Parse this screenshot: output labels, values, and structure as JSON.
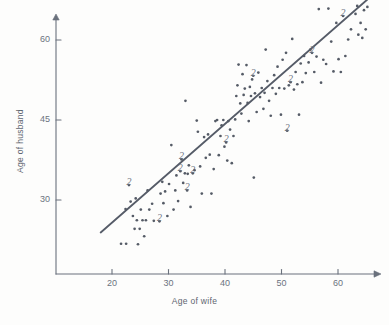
{
  "figure": {
    "background": "#fdfdfc",
    "ink_color": "#6a717c",
    "point_color": "#555b66",
    "line_color": "#565c68"
  },
  "axes": {
    "x_title": "Age of wife",
    "y_title": "Age of husband",
    "x_ticks": [
      20,
      30,
      40,
      50,
      60
    ],
    "y_ticks": [
      30,
      45,
      60
    ],
    "x_tick_labels": [
      "20",
      "30",
      "40",
      "50",
      "60"
    ],
    "y_tick_labels": [
      "30",
      "45",
      "60"
    ],
    "xlim": [
      12,
      67
    ],
    "ylim": [
      18,
      68
    ],
    "x_axis_pixel_y": 274,
    "y_axis_pixel_x": 56,
    "px_per_year_x": 5.65,
    "px_per_year_y": 5.333,
    "grid": false,
    "arrows": true
  },
  "chart_data": {
    "type": "scatter",
    "title": "",
    "xlabel": "Age of wife",
    "ylabel": "Age of husband",
    "xlim": [
      12,
      67
    ],
    "ylim": [
      18,
      68
    ],
    "grid": false,
    "legend": "none",
    "marker": "dot",
    "duplicate_marker_label": "2",
    "annotations": [
      {
        "text": "2",
        "x": 23.0,
        "y": 32.8
      },
      {
        "text": "2",
        "x": 28.4,
        "y": 26.0
      },
      {
        "text": "2",
        "x": 32.3,
        "y": 37.6
      },
      {
        "text": "2",
        "x": 32.1,
        "y": 35.4
      },
      {
        "text": "2",
        "x": 33.3,
        "y": 31.8
      },
      {
        "text": "2",
        "x": 34.3,
        "y": 35.0
      },
      {
        "text": "2",
        "x": 40.2,
        "y": 40.8
      },
      {
        "text": "2",
        "x": 45.0,
        "y": 53.3
      },
      {
        "text": "2",
        "x": 51.0,
        "y": 43.0
      },
      {
        "text": "2",
        "x": 51.6,
        "y": 52.1
      },
      {
        "text": "2",
        "x": 55.4,
        "y": 57.6
      },
      {
        "text": "2",
        "x": 60.9,
        "y": 64.5
      }
    ],
    "regression_line": {
      "x1": 18.0,
      "y1": 23.9,
      "x2": 65.2,
      "y2": 67.6,
      "style": "solid",
      "color": "#565c68"
    },
    "points": [
      [
        21.6,
        21.8
      ],
      [
        22.5,
        21.8
      ],
      [
        22.4,
        28.3
      ],
      [
        23.0,
        32.8
      ],
      [
        23.3,
        29.7
      ],
      [
        23.7,
        27.0
      ],
      [
        24.0,
        24.6
      ],
      [
        24.2,
        30.3
      ],
      [
        24.4,
        26.2
      ],
      [
        24.6,
        21.7
      ],
      [
        24.9,
        24.6
      ],
      [
        25.1,
        28.2
      ],
      [
        25.4,
        26.2
      ],
      [
        25.7,
        23.2
      ],
      [
        26.0,
        26.2
      ],
      [
        26.3,
        31.8
      ],
      [
        26.6,
        28.2
      ],
      [
        27.1,
        29.3
      ],
      [
        27.4,
        26.1
      ],
      [
        28.4,
        26.0
      ],
      [
        28.6,
        31.2
      ],
      [
        28.9,
        33.4
      ],
      [
        29.1,
        29.4
      ],
      [
        29.4,
        31.6
      ],
      [
        29.8,
        27.0
      ],
      [
        30.1,
        33.0
      ],
      [
        30.5,
        40.3
      ],
      [
        30.9,
        28.2
      ],
      [
        31.2,
        31.8
      ],
      [
        31.4,
        34.6
      ],
      [
        31.7,
        29.8
      ],
      [
        32.1,
        35.4
      ],
      [
        32.3,
        37.6
      ],
      [
        32.6,
        33.2
      ],
      [
        32.9,
        35.0
      ],
      [
        33.0,
        48.6
      ],
      [
        33.3,
        31.8
      ],
      [
        33.4,
        34.9
      ],
      [
        33.6,
        36.5
      ],
      [
        33.9,
        28.7
      ],
      [
        34.3,
        35.0
      ],
      [
        34.6,
        35.6
      ],
      [
        35.0,
        44.9
      ],
      [
        35.2,
        42.8
      ],
      [
        35.6,
        36.3
      ],
      [
        35.9,
        31.2
      ],
      [
        36.3,
        41.8
      ],
      [
        36.6,
        37.9
      ],
      [
        37.0,
        42.3
      ],
      [
        37.3,
        38.5
      ],
      [
        37.6,
        31.2
      ],
      [
        38.0,
        35.8
      ],
      [
        38.3,
        44.8
      ],
      [
        38.6,
        45.0
      ],
      [
        38.9,
        38.4
      ],
      [
        39.2,
        42.0
      ],
      [
        39.4,
        44.0
      ],
      [
        39.7,
        45.0
      ],
      [
        39.9,
        40.0
      ],
      [
        40.2,
        40.8
      ],
      [
        40.4,
        37.4
      ],
      [
        40.6,
        44.8
      ],
      [
        40.9,
        43.2
      ],
      [
        41.2,
        36.9
      ],
      [
        41.5,
        42.0
      ],
      [
        41.8,
        45.1
      ],
      [
        42.0,
        49.5
      ],
      [
        42.2,
        51.5
      ],
      [
        42.4,
        55.4
      ],
      [
        42.7,
        48.1
      ],
      [
        42.9,
        46.2
      ],
      [
        43.1,
        53.6
      ],
      [
        43.3,
        49.7
      ],
      [
        43.5,
        50.9
      ],
      [
        43.8,
        55.3
      ],
      [
        44.0,
        48.2
      ],
      [
        44.2,
        44.8
      ],
      [
        44.4,
        51.2
      ],
      [
        44.6,
        49.5
      ],
      [
        44.8,
        52.6
      ],
      [
        45.0,
        53.3
      ],
      [
        45.1,
        34.2
      ],
      [
        45.3,
        50.0
      ],
      [
        45.6,
        46.5
      ],
      [
        45.9,
        53.9
      ],
      [
        46.2,
        49.3
      ],
      [
        46.5,
        51.0
      ],
      [
        46.8,
        47.1
      ],
      [
        47.0,
        50.1
      ],
      [
        47.2,
        58.2
      ],
      [
        47.5,
        52.3
      ],
      [
        47.8,
        48.6
      ],
      [
        48.1,
        45.8
      ],
      [
        48.4,
        51.0
      ],
      [
        48.7,
        53.4
      ],
      [
        49.0,
        49.9
      ],
      [
        49.3,
        55.0
      ],
      [
        49.6,
        51.0
      ],
      [
        49.9,
        46.0
      ],
      [
        50.2,
        56.3
      ],
      [
        50.5,
        50.9
      ],
      [
        50.8,
        57.6
      ],
      [
        51.0,
        43.0
      ],
      [
        51.3,
        51.5
      ],
      [
        51.6,
        52.1
      ],
      [
        51.9,
        60.2
      ],
      [
        52.2,
        50.7
      ],
      [
        52.5,
        54.0
      ],
      [
        52.8,
        51.7
      ],
      [
        53.1,
        46.0
      ],
      [
        53.4,
        55.6
      ],
      [
        53.7,
        52.1
      ],
      [
        54.0,
        57.0
      ],
      [
        54.3,
        53.8
      ],
      [
        54.8,
        55.8
      ],
      [
        55.1,
        58.2
      ],
      [
        55.4,
        57.6
      ],
      [
        55.8,
        54.0
      ],
      [
        56.2,
        56.9
      ],
      [
        56.6,
        65.8
      ],
      [
        57.0,
        52.0
      ],
      [
        57.4,
        56.3
      ],
      [
        57.9,
        55.5
      ],
      [
        58.3,
        65.9
      ],
      [
        58.8,
        59.7
      ],
      [
        59.2,
        54.1
      ],
      [
        59.7,
        63.2
      ],
      [
        60.1,
        56.4
      ],
      [
        60.5,
        54.0
      ],
      [
        60.9,
        64.5
      ],
      [
        61.3,
        57.0
      ],
      [
        61.8,
        60.1
      ],
      [
        62.3,
        62.0
      ],
      [
        63.1,
        64.9
      ],
      [
        63.4,
        66.4
      ],
      [
        63.6,
        61.0
      ],
      [
        64.0,
        63.2
      ],
      [
        64.3,
        60.4
      ],
      [
        64.6,
        65.6
      ],
      [
        64.9,
        62.0
      ],
      [
        65.2,
        66.2
      ]
    ]
  }
}
